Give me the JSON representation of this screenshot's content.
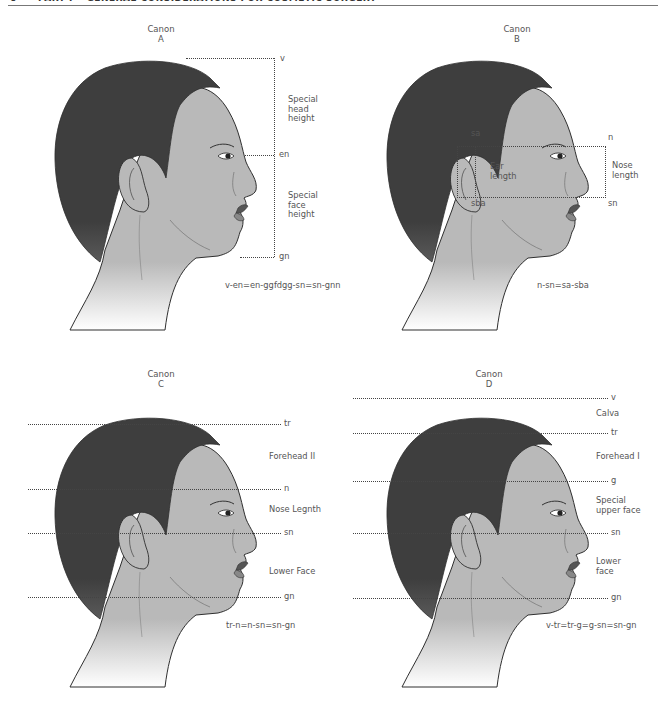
{
  "header": {
    "page_number": "6",
    "running_title": "PART I • GENERAL CONSIDERATIONS FOR COSMETIC SURGERY"
  },
  "colors": {
    "skin": "#b9b9b9",
    "hair": "#3e3e3e",
    "outline": "#2f2f2f",
    "text": "#555555",
    "dotted_line": "#444444"
  },
  "panels": [
    {
      "id": "A",
      "title_line1": "Canon",
      "title_line2": "A",
      "landmarks": [
        "v",
        "en",
        "gn"
      ],
      "labels": [
        {
          "text_lines": [
            "Special",
            "head",
            "height"
          ]
        },
        {
          "text_lines": [
            "Special",
            "face",
            "height"
          ]
        }
      ],
      "formula": "v-en=en-ggfdgg-sn=sn-gnn"
    },
    {
      "id": "B",
      "title_line1": "Canon",
      "title_line2": "B",
      "landmarks": [
        "sa",
        "sba",
        "n",
        "sn"
      ],
      "labels": [
        {
          "text_lines": [
            "Ear",
            "length"
          ]
        },
        {
          "text_lines": [
            "Nose",
            "length"
          ]
        }
      ],
      "formula": "n-sn=sa-sba"
    },
    {
      "id": "C",
      "title_line1": "Canon",
      "title_line2": "C",
      "landmarks": [
        "tr",
        "n",
        "sn",
        "gn"
      ],
      "labels": [
        {
          "text_lines": [
            "Forehead II"
          ]
        },
        {
          "text_lines": [
            "Nose Legnth"
          ]
        },
        {
          "text_lines": [
            "Lower Face"
          ]
        }
      ],
      "formula": "tr-n=n-sn=sn-gn"
    },
    {
      "id": "D",
      "title_line1": "Canon",
      "title_line2": "D",
      "landmarks": [
        "v",
        "tr",
        "g",
        "sn",
        "gn"
      ],
      "labels": [
        {
          "text_lines": [
            "Calva"
          ]
        },
        {
          "text_lines": [
            "Forehead I"
          ]
        },
        {
          "text_lines": [
            "Special",
            "upper face"
          ]
        },
        {
          "text_lines": [
            "Lower",
            "face"
          ]
        }
      ],
      "formula": "v-tr=tr-g=g-sn=sn-gn"
    }
  ]
}
